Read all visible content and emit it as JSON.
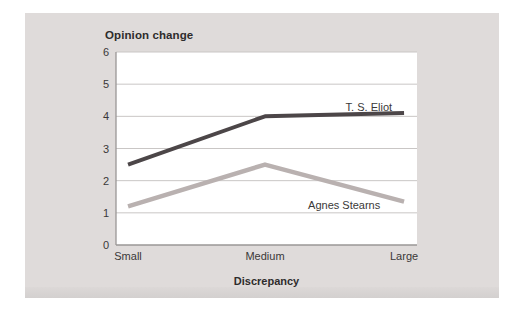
{
  "page": {
    "background_color": "#ffffff"
  },
  "card": {
    "background_color": "#dfdbda",
    "bottom_strip_color": "#d3d0cf"
  },
  "chart_data": {
    "type": "line",
    "title": "Opinion change",
    "xlabel": "Discrepancy",
    "ylabel": "Opinion change",
    "categories": [
      "Small",
      "Medium",
      "Large"
    ],
    "x_fractions": [
      0.04,
      0.495,
      0.957
    ],
    "ylim": [
      0,
      6
    ],
    "yticks": [
      0,
      1,
      2,
      3,
      4,
      5,
      6
    ],
    "grid": "horizontal",
    "legend": "inline-labels",
    "plot_background": "#ffffff",
    "grid_color": "#c9c6c5",
    "axis_color": "#9a9796",
    "text_color": "#3a3838",
    "series": [
      {
        "name": "T. S. Eliot",
        "values": [
          2.5,
          4.0,
          4.1
        ],
        "color": "#4c4648",
        "stroke_width": 4,
        "label": {
          "x_frac": 0.84,
          "y_value": 4.3
        }
      },
      {
        "name": "Agnes Stearns",
        "values": [
          1.2,
          2.5,
          1.35
        ],
        "color": "#b9b1b0",
        "stroke_width": 4.5,
        "label": {
          "x_frac": 0.758,
          "y_value": 1.25
        }
      }
    ]
  }
}
